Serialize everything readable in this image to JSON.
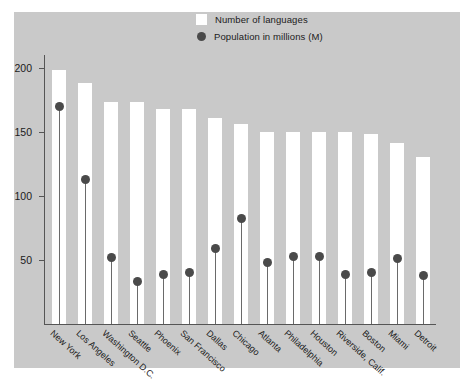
{
  "legend": {
    "items": [
      {
        "label": "Number of languages",
        "marker": "white-square",
        "color": "#ffffff"
      },
      {
        "label": "Population in millions (M)",
        "marker": "dark-circle",
        "color": "#4a4a4a"
      }
    ]
  },
  "colors": {
    "panel_background": "#c9c9c9",
    "bar": "#ffffff",
    "dot": "#4a4a4a",
    "axis": "#555555",
    "text": "#1b1b1b"
  },
  "chart_data": {
    "type": "bar",
    "title": "",
    "subtitle": "",
    "xlabel": "",
    "ylabel": "",
    "ylim": [
      0,
      210
    ],
    "yticks": [
      50,
      100,
      150,
      200
    ],
    "grid": false,
    "legend_position": "top-center",
    "categories": [
      "New York",
      "Los Angeles",
      "Washington D.C.",
      "Seattle",
      "Phoenix",
      "San Francisco",
      "Dallas",
      "Chicago",
      "Atlanta",
      "Philadelphia",
      "Houston",
      "Riverside, Calif.",
      "Boston",
      "Miami",
      "Detroit"
    ],
    "series": [
      {
        "name": "Number of languages",
        "type": "bar",
        "values": [
          198,
          188,
          173,
          173,
          168,
          168,
          161,
          156,
          150,
          150,
          150,
          150,
          148,
          141,
          130
        ]
      },
      {
        "name": "Population in millions (M)",
        "type": "scatter",
        "values": [
          170,
          113,
          52,
          33,
          39,
          40,
          59,
          82,
          48,
          53,
          53,
          39,
          40,
          51,
          38
        ]
      }
    ]
  }
}
